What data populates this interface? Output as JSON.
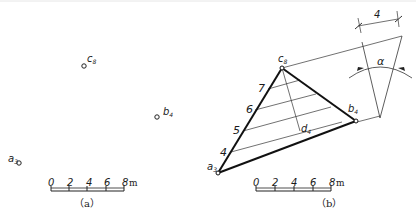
{
  "panel_a": {
    "caption": "（a）",
    "points": [
      {
        "name": "c",
        "sub": "8",
        "x": 84,
        "y": 66
      },
      {
        "name": "b",
        "sub": "4",
        "x": 157,
        "y": 117
      },
      {
        "name": "a",
        "sub": "3",
        "x": 17,
        "y": 160
      }
    ],
    "scale": {
      "ticks": [
        "0",
        "2",
        "4",
        "6",
        "8"
      ],
      "unit": "m"
    }
  },
  "panel_b": {
    "caption": "（b）",
    "points": [
      {
        "name": "c",
        "sub": "8"
      },
      {
        "name": "b",
        "sub": "4"
      },
      {
        "name": "a",
        "sub": "3"
      },
      {
        "name": "d",
        "sub": "4"
      }
    ],
    "division_labels": [
      "7",
      "6",
      "5",
      "4"
    ],
    "scale": {
      "ticks": [
        "0",
        "2",
        "4",
        "6",
        "8"
      ],
      "unit": "m"
    },
    "dimension_label": "4",
    "angle_label": "α"
  }
}
